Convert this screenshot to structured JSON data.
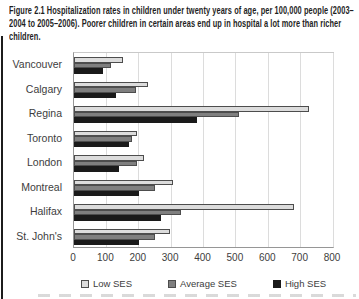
{
  "figure": {
    "caption": "Figure 2.1 Hospitalization rates in children under twenty years of age, per 100,000 people (2003–2004 to 2005–2006). Poorer children in certain areas end up in hospital a lot more than richer children."
  },
  "chart_data": {
    "type": "bar",
    "orientation": "horizontal",
    "title": "Hospitalization rates in children under twenty years of age, per 100,000 people (2003–2004 to 2005–2006)",
    "categories": [
      "Vancouver",
      "Calgary",
      "Regina",
      "Toronto",
      "London",
      "Montreal",
      "Halifax",
      "St. John's"
    ],
    "series": [
      {
        "name": "Low SES",
        "color": "#dcdcdc",
        "border": "#4d4d4d",
        "values": [
          150,
          230,
          725,
          195,
          215,
          305,
          680,
          295
        ]
      },
      {
        "name": "Average SES",
        "color": "#7f7f7f",
        "border": "#4d4d4d",
        "values": [
          115,
          190,
          510,
          180,
          195,
          250,
          330,
          250
        ]
      },
      {
        "name": "High SES",
        "color": "#1a1a1a",
        "border": "#1a1a1a",
        "values": [
          90,
          130,
          380,
          170,
          140,
          200,
          270,
          200
        ]
      }
    ],
    "xlabel": "",
    "ylabel": "",
    "xlim": [
      0,
      800
    ],
    "xticks": [
      0,
      100,
      200,
      300,
      400,
      500,
      600,
      700,
      800
    ],
    "grid": true,
    "legend_position": "bottom",
    "colors": {
      "gridline": "#dcdcdc",
      "axis": "#969696",
      "text": "#3d3d3d"
    }
  }
}
